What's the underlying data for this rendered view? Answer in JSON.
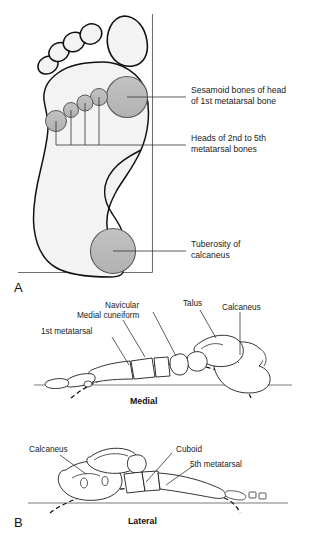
{
  "figure": {
    "panels": [
      {
        "letter": "A",
        "name": "plantar-weight-bearing-view",
        "labels": [
          {
            "id": "sesamoid",
            "line1": "Sesamoid bones of head",
            "line2": "of 1st metatarsal bone"
          },
          {
            "id": "metatarsal-heads",
            "line1": "Heads of 2nd to 5th",
            "line2": "metatarsal bones"
          },
          {
            "id": "tuberosity",
            "line1": "Tuberosity of",
            "line2": "calcaneus"
          }
        ],
        "contact_points": [
          {
            "id": "sesamoid-pad",
            "label": "Sesamoid bones of head of 1st metatarsal bone",
            "cx": 127,
            "cy": 97,
            "r": 20.5
          },
          {
            "id": "metatarsal-head-2",
            "label": "Head of 2nd metatarsal bone",
            "cx": 99,
            "cy": 97,
            "r": 8.5
          },
          {
            "id": "metatarsal-head-3",
            "label": "Head of 3rd metatarsal bone",
            "cx": 85,
            "cy": 103,
            "r": 8.0
          },
          {
            "id": "metatarsal-head-4",
            "label": "Head of 4th metatarsal bone",
            "cx": 71,
            "cy": 110,
            "r": 7.5
          },
          {
            "id": "metatarsal-head-5",
            "label": "Head of 5th metatarsal bone",
            "cx": 56,
            "cy": 121,
            "r": 10.5
          },
          {
            "id": "calcaneal-tuberosity-pad",
            "label": "Tuberosity of calcaneus",
            "cx": 113,
            "cy": 251,
            "r": 22.5
          }
        ],
        "toes": [
          {
            "id": "toe-1-hallux",
            "label": "Great toe pad"
          },
          {
            "id": "toe-2",
            "label": "2nd toe pad"
          },
          {
            "id": "toe-3",
            "label": "3rd toe pad"
          },
          {
            "id": "toe-4",
            "label": "4th toe pad"
          },
          {
            "id": "toe-5",
            "label": "5th toe pad"
          }
        ]
      },
      {
        "letter": "B",
        "name": "longitudinal-arch-views",
        "views": [
          {
            "id": "medial-view",
            "caption": "Medial",
            "labels": [
              {
                "id": "medial-cuneiform",
                "text": "Medial cuneiform"
              },
              {
                "id": "navicular",
                "text": "Navicular"
              },
              {
                "id": "talus",
                "text": "Talus"
              },
              {
                "id": "calcaneus-medial",
                "text": "Calcaneus"
              },
              {
                "id": "first-metatarsal",
                "text": "1st metatarsal"
              }
            ]
          },
          {
            "id": "lateral-view",
            "caption": "Lateral",
            "labels": [
              {
                "id": "calcaneus-lateral",
                "text": "Calcaneus"
              },
              {
                "id": "cuboid",
                "text": "Cuboid"
              },
              {
                "id": "fifth-metatarsal",
                "text": "5th metatarsal"
              }
            ]
          }
        ]
      }
    ],
    "colors": {
      "contact_fill": "#b9b9b9",
      "contact_stroke": "#5a5a5a",
      "sole_fill": "#f3f3f3",
      "outline": "#111111",
      "leader": "#333333",
      "axis": "#6f6f6f",
      "background": "#ffffff"
    }
  }
}
